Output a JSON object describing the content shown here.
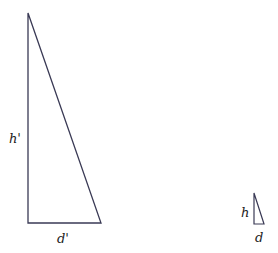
{
  "diagram": {
    "type": "similar-triangles",
    "large_triangle": {
      "height_label": "h'",
      "base_label": "d'",
      "points": "28,13 28,223 101,223",
      "stroke": "#3a3a55"
    },
    "small_triangle": {
      "height_label": "h",
      "base_label": "d",
      "points": "254,193 254,224 264,224",
      "stroke": "#3a3a55"
    }
  }
}
